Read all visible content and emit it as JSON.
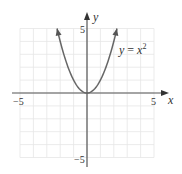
{
  "chart_data": {
    "type": "line",
    "title": "",
    "function": "y = x^2",
    "series": [
      {
        "name": "y = x²",
        "x": [
          -2.24,
          -2,
          -1.5,
          -1,
          -0.5,
          0,
          0.5,
          1,
          1.5,
          2,
          2.24
        ],
        "values": [
          5,
          4,
          2.25,
          1,
          0.25,
          0,
          0.25,
          1,
          2.25,
          4,
          5
        ],
        "arrows_at_ends": true
      }
    ],
    "xlabel": "x",
    "ylabel": "y",
    "xlim": [
      -5,
      5
    ],
    "ylim": [
      -5,
      5
    ],
    "x_ticks_labeled": [
      "-5",
      "5"
    ],
    "y_ticks_labeled": [
      "5",
      "-5"
    ],
    "grid": true,
    "annotation": "y = x²"
  },
  "labels": {
    "x_axis": "x",
    "y_axis": "y",
    "x_min": "−5",
    "x_max": "5",
    "y_max": "5",
    "y_min": "−5",
    "curve_name": "y",
    "curve_eq": " = ",
    "curve_rhs": "x",
    "curve_exp": "2"
  },
  "colors": {
    "grid": "#e6e6e6",
    "axis": "#555555",
    "curve": "#666666"
  }
}
